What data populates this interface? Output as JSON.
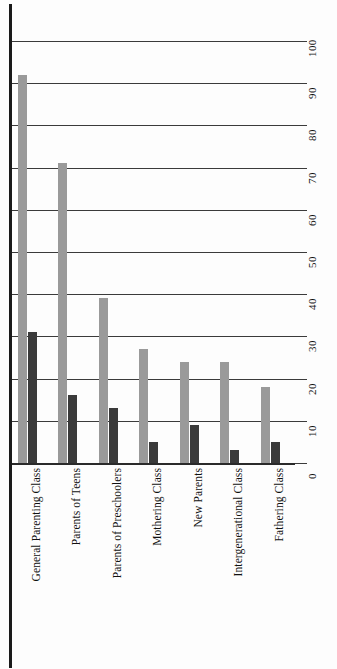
{
  "chart_data": {
    "type": "bar",
    "title": "",
    "subtitle": "",
    "xlabel": "",
    "ylabel": "",
    "ylim": [
      0,
      100
    ],
    "yticks": [
      0,
      10,
      20,
      30,
      40,
      50,
      60,
      70,
      80,
      90,
      100
    ],
    "ytick_labels": [
      "0",
      "10",
      "20",
      "30",
      "40",
      "50",
      "60",
      "70",
      "80",
      "90",
      "100"
    ],
    "grid": true,
    "legend": "none",
    "orientation": "vertical",
    "grouping": "grouped",
    "categories": [
      "General Parenting Class",
      "Parents of Teens",
      "Parents of Preschoolers",
      "Mothering Class",
      "New Parents",
      "Intergenerational Class",
      "Fathering Class"
    ],
    "series": [
      {
        "name": "series-1",
        "color": "#9a9a9a",
        "values": [
          92,
          71,
          39,
          27,
          24,
          24,
          18
        ]
      },
      {
        "name": "series-2",
        "color": "#3a3a3a",
        "values": [
          31,
          16,
          13,
          5,
          9,
          3,
          5
        ]
      }
    ]
  },
  "colors": {
    "series_1": "#9a9a9a",
    "series_2": "#3a3a3a",
    "gridline": "#3b3b3b",
    "axis": "#1a1a1a",
    "background": "#fdfdfd",
    "text": "#111111"
  }
}
